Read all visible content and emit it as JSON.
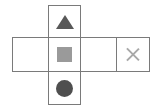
{
  "diagram": {
    "background_color": "#ffffff",
    "border_color": "#7a7a7a",
    "layout": "cross",
    "column": {
      "name": "vertical-column",
      "cells": [
        {
          "position": "top",
          "icon": "triangle-icon",
          "label": "",
          "color": "#585858",
          "filled": true
        },
        {
          "position": "center",
          "icon": "square-icon",
          "label": "",
          "color": "#9a9a9a",
          "filled": true
        },
        {
          "position": "bottom",
          "icon": "circle-icon",
          "label": "",
          "color": "#4f4f4f",
          "filled": true
        }
      ]
    },
    "row": {
      "name": "horizontal-row",
      "cells": [
        {
          "position": "far-left",
          "icon": "",
          "label": "",
          "color": "",
          "filled": false
        },
        {
          "position": "center",
          "icon": "square-icon",
          "label": "",
          "color": "#9a9a9a",
          "filled": true
        },
        {
          "position": "mid-right",
          "icon": "",
          "label": "",
          "color": "",
          "filled": false
        },
        {
          "position": "far-right",
          "icon": "close-icon",
          "label": "",
          "color": "#a8a8a8",
          "filled": false
        }
      ]
    }
  }
}
